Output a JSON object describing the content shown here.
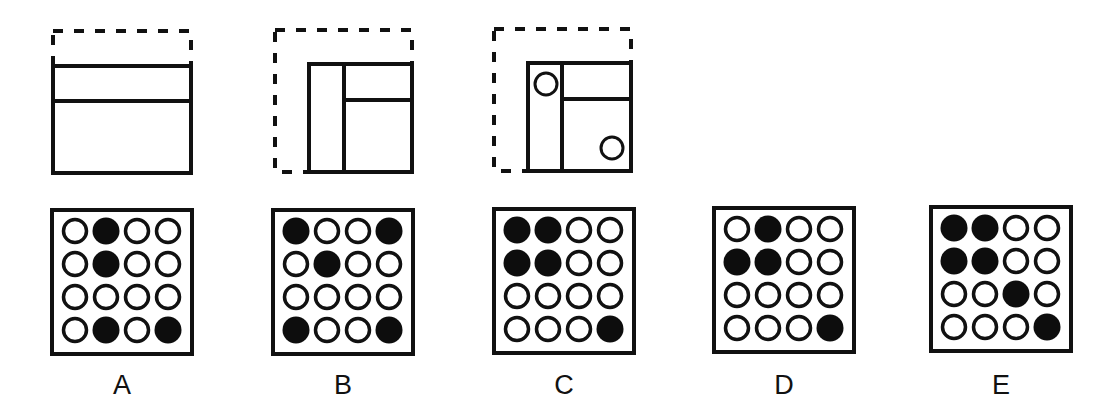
{
  "sequence": {
    "description": "Folding/sequence puzzle: a square outline with panels progressively folded, with circles punched",
    "steps": [
      {
        "id": "step-1",
        "dashed_outline": {
          "x": 53,
          "y": 31,
          "w": 138,
          "h": 142
        },
        "solid_rect": {
          "x": 53,
          "y": 66,
          "w": 138,
          "h": 107
        },
        "lines": [
          {
            "x1": 53,
            "y1": 101,
            "x2": 191,
            "y2": 101
          }
        ],
        "circles": []
      },
      {
        "id": "step-2",
        "dashed_outline": {
          "x": 275,
          "y": 30,
          "w": 137,
          "h": 142
        },
        "solid_rect": {
          "x": 309,
          "y": 64,
          "w": 103,
          "h": 108
        },
        "lines": [
          {
            "x1": 344,
            "y1": 64,
            "x2": 344,
            "y2": 172
          },
          {
            "x1": 344,
            "y1": 100,
            "x2": 412,
            "y2": 100
          }
        ],
        "circles": []
      },
      {
        "id": "step-3",
        "dashed_outline": {
          "x": 494,
          "y": 29,
          "w": 137,
          "h": 142
        },
        "solid_rect": {
          "x": 528,
          "y": 63,
          "w": 103,
          "h": 108
        },
        "lines": [
          {
            "x1": 562,
            "y1": 63,
            "x2": 562,
            "y2": 171
          },
          {
            "x1": 562,
            "y1": 99,
            "x2": 631,
            "y2": 99
          }
        ],
        "circles": [
          {
            "cx": 546,
            "cy": 84,
            "r": 11
          },
          {
            "cx": 612,
            "cy": 148,
            "r": 11
          }
        ]
      }
    ]
  },
  "options": [
    {
      "label": "A",
      "box": {
        "x": 52,
        "y": 210
      },
      "grid": [
        [
          0,
          1,
          0,
          0
        ],
        [
          0,
          1,
          0,
          0
        ],
        [
          0,
          0,
          0,
          0
        ],
        [
          0,
          1,
          0,
          1
        ]
      ]
    },
    {
      "label": "B",
      "box": {
        "x": 273,
        "y": 210
      },
      "grid": [
        [
          1,
          0,
          0,
          1
        ],
        [
          0,
          1,
          0,
          0
        ],
        [
          0,
          0,
          0,
          0
        ],
        [
          1,
          0,
          0,
          1
        ]
      ]
    },
    {
      "label": "C",
      "box": {
        "x": 494,
        "y": 209
      },
      "grid": [
        [
          1,
          1,
          0,
          0
        ],
        [
          1,
          1,
          0,
          0
        ],
        [
          0,
          0,
          0,
          0
        ],
        [
          0,
          0,
          0,
          1
        ]
      ]
    },
    {
      "label": "D",
      "box": {
        "x": 714,
        "y": 208
      },
      "grid": [
        [
          0,
          1,
          0,
          0
        ],
        [
          1,
          1,
          0,
          0
        ],
        [
          0,
          0,
          0,
          0
        ],
        [
          0,
          0,
          0,
          1
        ]
      ]
    },
    {
      "label": "E",
      "box": {
        "x": 931,
        "y": 207
      },
      "grid": [
        [
          1,
          1,
          0,
          0
        ],
        [
          1,
          1,
          0,
          0
        ],
        [
          0,
          0,
          1,
          0
        ],
        [
          0,
          0,
          0,
          1
        ]
      ]
    }
  ],
  "colors": {
    "stroke": "#111111",
    "fill_dot": "#0d0d0d",
    "background": "#ffffff"
  }
}
